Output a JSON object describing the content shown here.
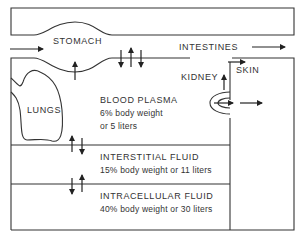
{
  "diagram": {
    "colors": {
      "line": "#333333",
      "text": "#333333",
      "background": "#ffffff"
    },
    "organs": {
      "stomach": "STOMACH",
      "intestines": "INTESTINES",
      "kidney": "KIDNEY",
      "skin": "SKIN",
      "lungs": "LUNGS"
    },
    "compartments": [
      {
        "name": "BLOOD PLASMA",
        "line1": "6% body weight",
        "line2": "or 5 liters"
      },
      {
        "name": "INTERSTITIAL FLUID",
        "line1": "15% body weight or 11 liters"
      },
      {
        "name": "INTRACELLULAR FLUID",
        "line1": "40% body weight or 30 liters"
      }
    ]
  }
}
